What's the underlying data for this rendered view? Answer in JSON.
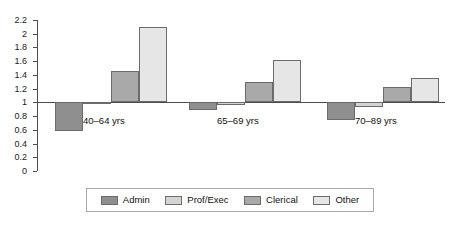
{
  "chart_data": {
    "type": "bar",
    "title": "",
    "subtitle": "",
    "xlabel": "",
    "ylabel": "",
    "categories": [
      "40–64 yrs",
      "65–69 yrs",
      "70–89 yrs"
    ],
    "series": [
      {
        "name": "Admin",
        "values": [
          0.58,
          0.89,
          0.74
        ],
        "color": "#8f8f8f"
      },
      {
        "name": "Prof/Exec",
        "values": [
          0.97,
          0.96,
          0.93
        ],
        "color": "#d4d4d4"
      },
      {
        "name": "Clerical",
        "values": [
          1.45,
          1.3,
          1.22
        ],
        "color": "#a9a9a9"
      },
      {
        "name": "Other",
        "values": [
          2.1,
          1.62,
          1.35
        ],
        "color": "#e6e6e6"
      }
    ],
    "baseline": 1,
    "ylim": [
      0,
      2.2
    ],
    "yticks": [
      "0",
      "0.2",
      "0.4",
      "0.6",
      "0.8",
      "1",
      "1.2",
      "1.4",
      "1.6",
      "1.8",
      "2",
      "2.2"
    ],
    "ytick_values": [
      0,
      0.2,
      0.4,
      0.6,
      0.8,
      1,
      1.2,
      1.4,
      1.6,
      1.8,
      2,
      2.2
    ],
    "grid": false,
    "legend_position": "bottom",
    "axis_color": "#4d4d4d",
    "bar_border_color": "#6b6b6b"
  }
}
